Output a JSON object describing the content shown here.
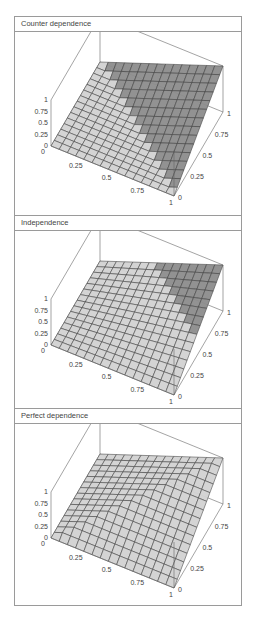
{
  "chart_data": [
    {
      "type": "surface",
      "title": "Counter dependence",
      "function": "max(u+v-1,0)",
      "x_ticks": [
        "0",
        "0.25",
        "0.5",
        "0.75",
        "1"
      ],
      "y_ticks": [
        "0",
        "0.25",
        "0.5",
        "0.75",
        "1"
      ],
      "z_ticks": [
        "0",
        "0.25",
        "0.5",
        "0.75",
        "1"
      ],
      "xlim": [
        0,
        1
      ],
      "ylim": [
        0,
        1
      ],
      "zlim": [
        0,
        1
      ],
      "grid": 15
    },
    {
      "type": "surface",
      "title": "Independence",
      "function": "u*v",
      "x_ticks": [
        "0",
        "0.25",
        "0.5",
        "0.75",
        "1"
      ],
      "y_ticks": [
        "0",
        "0.25",
        "0.5",
        "0.75",
        "1"
      ],
      "z_ticks": [
        "0",
        "0.25",
        "0.5",
        "0.75",
        "1"
      ],
      "xlim": [
        0,
        1
      ],
      "ylim": [
        0,
        1
      ],
      "zlim": [
        0,
        1
      ],
      "grid": 15
    },
    {
      "type": "surface",
      "title": "Perfect dependence",
      "function": "min(u,v)",
      "x_ticks": [
        "0",
        "0.25",
        "0.5",
        "0.75",
        "1"
      ],
      "y_ticks": [
        "0",
        "0.25",
        "0.5",
        "0.75",
        "1"
      ],
      "z_ticks": [
        "0",
        "0.25",
        "0.5",
        "0.75",
        "1"
      ],
      "xlim": [
        0,
        1
      ],
      "ylim": [
        0,
        1
      ],
      "zlim": [
        0,
        1
      ],
      "grid": 15
    }
  ],
  "colors": {
    "surface_light": "#d2d2d2",
    "surface_dark": "#8c8c8c",
    "grid_line": "#3f3f3f",
    "box_line": "#666666",
    "border": "#9a9a9a"
  }
}
